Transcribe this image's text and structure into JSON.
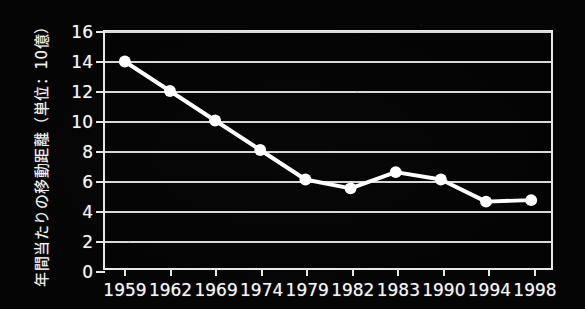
{
  "chart_data": {
    "type": "line",
    "title": "",
    "xlabel": "",
    "ylabel": "年間当たりの移動距離（単位：10億）",
    "categories": [
      "1959",
      "1962",
      "1969",
      "1974",
      "1979",
      "1982",
      "1983",
      "1990",
      "1994",
      "1998"
    ],
    "values": [
      14.0,
      12.0,
      10.0,
      8.0,
      6.0,
      5.4,
      6.5,
      6.0,
      4.5,
      4.6
    ],
    "series": [
      {
        "name": "年間当たりの移動距離",
        "values": [
          14.0,
          12.0,
          10.0,
          8.0,
          6.0,
          5.4,
          6.5,
          6.0,
          4.5,
          4.6
        ]
      }
    ],
    "ylim": [
      0,
      16
    ],
    "yticks": [
      0,
      2,
      4,
      6,
      8,
      10,
      12,
      14,
      16
    ],
    "ytick_labels": [
      "0",
      "2",
      "4",
      "6",
      "8",
      "10",
      "12",
      "14",
      "16"
    ],
    "grid": true,
    "grid_axis": "y",
    "legend": "none",
    "marker": "circle",
    "colors": {
      "background": "#000000",
      "line": "#ffffff",
      "marker": "#ffffff",
      "grid": "#d8d8d8",
      "axis": "#e8e8e8",
      "text": "#f4f4f4"
    }
  }
}
